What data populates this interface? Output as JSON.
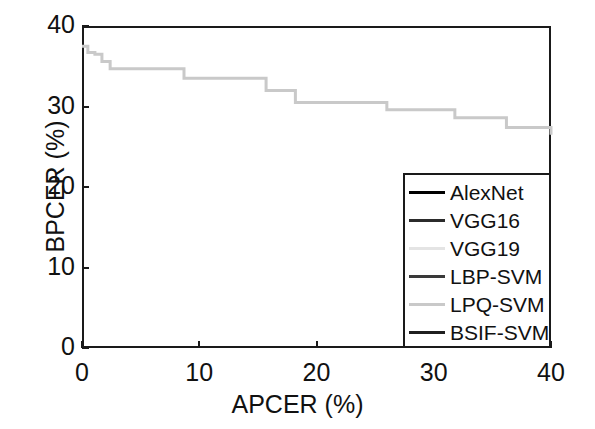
{
  "chart_data": {
    "type": "line",
    "title": "",
    "xlabel": "APCER (%)",
    "ylabel": "BPCER (%)",
    "xlim": [
      0,
      40
    ],
    "ylim": [
      0,
      40
    ],
    "xticks": [
      0,
      10,
      20,
      30,
      40
    ],
    "yticks": [
      0,
      10,
      20,
      30,
      40
    ],
    "xticklabels": [
      "0",
      "10",
      "20",
      "30",
      "40"
    ],
    "yticklabels": [
      "0",
      "10",
      "20",
      "30",
      "40"
    ],
    "grid": false,
    "legend_position": "lower right",
    "series": [
      {
        "name": "AlexNet",
        "color": "#000000",
        "visible_in_plot": false,
        "x": [],
        "y": []
      },
      {
        "name": "VGG16",
        "color": "#2b2b2b",
        "visible_in_plot": false,
        "x": [],
        "y": []
      },
      {
        "name": "VGG19",
        "color": "#e4e4e4",
        "visible_in_plot": false,
        "x": [],
        "y": []
      },
      {
        "name": "LBP-SVM",
        "color": "#3a3a3a",
        "visible_in_plot": false,
        "x": [],
        "y": []
      },
      {
        "name": "LPQ-SVM",
        "color": "#c9c9c9",
        "visible_in_plot": true,
        "step": "post",
        "x": [
          0.0,
          0.5,
          1.1,
          1.7,
          2.4,
          5.6,
          8.7,
          15.7,
          18.2,
          26.0,
          31.8,
          36.2,
          40.0
        ],
        "y": [
          37.5,
          36.7,
          36.5,
          35.6,
          34.7,
          34.7,
          33.5,
          32.0,
          30.5,
          29.6,
          28.6,
          27.4,
          26.5
        ]
      },
      {
        "name": "BSIF-SVM",
        "color": "#1f1f1f",
        "visible_in_plot": false,
        "x": [],
        "y": []
      }
    ]
  },
  "legend": {
    "entries": [
      {
        "label": "AlexNet",
        "color": "#000000"
      },
      {
        "label": "VGG16",
        "color": "#2b2b2b"
      },
      {
        "label": "VGG19",
        "color": "#e4e4e4"
      },
      {
        "label": "LBP-SVM",
        "color": "#3a3a3a"
      },
      {
        "label": "LPQ-SVM",
        "color": "#c9c9c9"
      },
      {
        "label": "BSIF-SVM",
        "color": "#1f1f1f"
      }
    ]
  },
  "axes": {
    "x_title": "APCER (%)",
    "y_title": "BPCER (%)",
    "x_ticklabels": [
      "0",
      "10",
      "20",
      "30",
      "40"
    ],
    "y_ticklabels": [
      "0",
      "10",
      "20",
      "30",
      "40"
    ],
    "frame_color": "#1a1a1a"
  }
}
